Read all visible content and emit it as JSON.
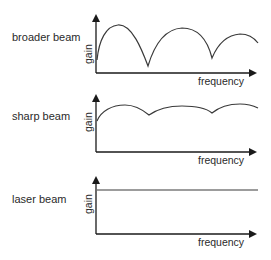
{
  "diagrams": [
    {
      "label": "broader beam",
      "y_axis_label": "gain",
      "x_axis_label": "frequency",
      "curve_description": "broad lobes with deep nulls between them"
    },
    {
      "label": "sharp beam",
      "y_axis_label": "gain",
      "x_axis_label": "frequency",
      "curve_description": "high gain with shallow ripples"
    },
    {
      "label": "laser beam",
      "y_axis_label": "gain",
      "x_axis_label": "frequency",
      "curve_description": "flat constant gain"
    }
  ],
  "colors": {
    "line": "#3a3a3a",
    "axis": "#1a1a1a",
    "text": "#2a2a2a",
    "background": "#ffffff"
  }
}
